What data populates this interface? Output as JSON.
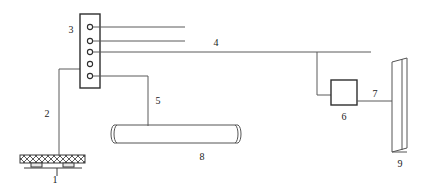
{
  "figure": {
    "type": "schematic-line-diagram",
    "background_color": "#ffffff",
    "line_color": "#5a5a5a",
    "outline_color": "#2e2e2e",
    "label_color": "#1a1a1a",
    "width": 425,
    "height": 186
  },
  "labels": {
    "item1": "1",
    "item2": "2",
    "item3": "3",
    "item4": "4",
    "item5": "5",
    "item6": "6",
    "item7": "7",
    "item8": "8",
    "item9": "9"
  },
  "components": [
    {
      "id": "1",
      "name": "hatched-platform",
      "shape": "cross-hatched-bar-with-feet",
      "label": "1",
      "label_x": 58,
      "label_y": 180,
      "x": 20,
      "y": 155,
      "width": 65,
      "height": 8
    },
    {
      "id": "2",
      "name": "connector-line-2",
      "shape": "vertical-line",
      "label": "2",
      "label_x": 47,
      "label_y": 114
    },
    {
      "id": "3",
      "name": "port-panel",
      "shape": "vertical-rectangle-with-5-ports",
      "label": "3",
      "label_x": 70,
      "label_y": 32,
      "x": 80,
      "y": 14,
      "width": 20,
      "height": 74,
      "port_count": 5
    },
    {
      "id": "4",
      "name": "main-signal-line",
      "shape": "long-horizontal-line",
      "label": "4",
      "label_x": 215,
      "label_y": 46
    },
    {
      "id": "5",
      "name": "connector-line-5",
      "shape": "stepped-line",
      "label": "5",
      "label_x": 157,
      "label_y": 101
    },
    {
      "id": "6",
      "name": "control-box",
      "shape": "square",
      "label": "6",
      "label_x": 343,
      "label_y": 120,
      "x": 331,
      "y": 80,
      "width": 26,
      "height": 25
    },
    {
      "id": "7",
      "name": "connector-line-7",
      "shape": "horizontal-line",
      "label": "7",
      "label_x": 374,
      "label_y": 95
    },
    {
      "id": "8",
      "name": "cylinder-tube",
      "shape": "horizontal-cylinder",
      "label": "8",
      "label_x": 202,
      "label_y": 158,
      "x": 112,
      "y": 124,
      "width": 128,
      "height": 19
    },
    {
      "id": "9",
      "name": "vertical-panel",
      "shape": "tall-narrow-panel",
      "label": "9",
      "label_x": 400,
      "label_y": 165,
      "x": 390,
      "y": 58,
      "width": 19,
      "height": 94
    }
  ]
}
